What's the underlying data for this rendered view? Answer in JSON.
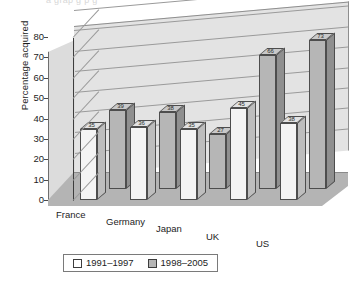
{
  "ghost_text": "a grap   g        p       g",
  "legend": {
    "position": "bottom",
    "entries": [
      {
        "label": "1991–1997",
        "swatch": "white"
      },
      {
        "label": "1998–2005",
        "swatch": "gray"
      }
    ]
  },
  "chart_data": {
    "type": "bar",
    "title": "",
    "subtitle": "",
    "xlabel": "",
    "ylabel": "Percentage acquired",
    "ylim": [
      0,
      80
    ],
    "ytick_step": 10,
    "yticks": [
      "0",
      "10",
      "20",
      "30",
      "40",
      "50",
      "60",
      "70",
      "80"
    ],
    "grid": true,
    "three_d": true,
    "legend_position": "bottom",
    "categories": [
      "France",
      "Germany",
      "Japan",
      "UK",
      "US"
    ],
    "series": [
      {
        "name": "1991–1997",
        "color": "#f4f4f4",
        "values": [
          35,
          36,
          35,
          45,
          38
        ]
      },
      {
        "name": "1998–2005",
        "color": "#b6b6b6",
        "values": [
          39,
          38,
          27,
          66,
          73
        ]
      }
    ],
    "data_labels": {
      "France": {
        "1991–1997": "35",
        "1998–2005": "39"
      },
      "Germany": {
        "1991–1997": "36",
        "1998–2005": "38"
      },
      "Japan": {
        "1991–1997": "35",
        "1998–2005": "27"
      },
      "UK": {
        "1991–1997": "45",
        "1998–2005": "66"
      },
      "US": {
        "1991–1997": "38",
        "1998–2005": "73"
      }
    },
    "colors": {
      "series1": "#f4f4f4",
      "series2": "#b6b6b6",
      "back_wall": "#e3e3e3",
      "side_wall": "#dcdcdc",
      "floor": "#b4b4b4",
      "gridline": "#9a9a9a",
      "outline": "#4d4d4d"
    }
  }
}
